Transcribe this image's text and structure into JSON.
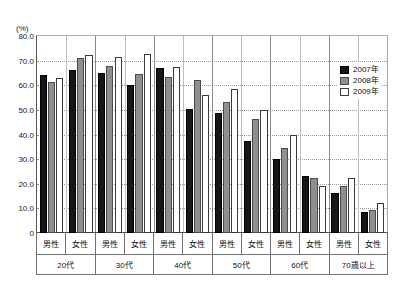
{
  "chart_data": {
    "type": "bar",
    "title": "",
    "subtitle": "",
    "unit_label": "(%)",
    "xlabel": "",
    "ylabel": "",
    "ylim": [
      0,
      80
    ],
    "ytick_labels": [
      "80.0",
      "70.0",
      "60.0",
      "50.0",
      "40.0",
      "30.0",
      "20.0",
      "10.0",
      "0"
    ],
    "ytick_values": [
      80,
      70,
      60,
      50,
      40,
      30,
      20,
      10,
      0
    ],
    "grid": true,
    "legend_position": "top-right",
    "age_groups": [
      "20代",
      "30代",
      "40代",
      "50代",
      "60代",
      "70歳以上"
    ],
    "genders": [
      "男性",
      "女性"
    ],
    "categories": [
      "20代 男性",
      "20代 女性",
      "30代 男性",
      "30代 女性",
      "40代 男性",
      "40代 女性",
      "50代 男性",
      "50代 女性",
      "60代 男性",
      "60代 女性",
      "70歳以上 男性",
      "70歳以上 女性"
    ],
    "series": [
      {
        "name": "2007年",
        "color": "#161616",
        "values": [
          64.0,
          66.4,
          64.9,
          60.0,
          67.2,
          50.5,
          48.8,
          37.4,
          30.2,
          23.0,
          16.3,
          8.5
        ]
      },
      {
        "name": "2008年",
        "color": "#8f8f8f",
        "values": [
          61.3,
          70.9,
          67.8,
          64.7,
          63.4,
          62.0,
          53.4,
          46.3,
          34.5,
          22.4,
          19.0,
          9.3
        ]
      },
      {
        "name": "2009年",
        "color": "#ffffff",
        "values": [
          63.0,
          72.3,
          71.5,
          72.5,
          67.6,
          55.9,
          58.5,
          50.1,
          39.8,
          19.2,
          22.5,
          12.2
        ]
      }
    ]
  },
  "legend": {
    "items": [
      {
        "label": "2007年"
      },
      {
        "label": "2008年"
      },
      {
        "label": "2009年"
      }
    ]
  }
}
